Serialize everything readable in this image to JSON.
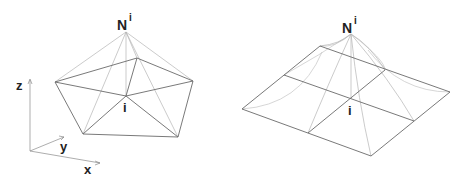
{
  "figure": {
    "left_panel": {
      "description": "Pyramid-shaped linear shape function over triangular elements around node i",
      "apex_label": "N",
      "apex_superscript": "i",
      "node_label": "i",
      "axes": {
        "z": "z",
        "y": "y",
        "x": "x"
      }
    },
    "right_panel": {
      "description": "Bilinear shape function over quadrilateral grid around node i",
      "apex_label": "N",
      "apex_superscript": "i",
      "node_label": "i"
    },
    "colors": {
      "edge": "#6a6a6a",
      "projection": "#b4b4b4",
      "text": "#222222",
      "background": "#ffffff"
    }
  }
}
